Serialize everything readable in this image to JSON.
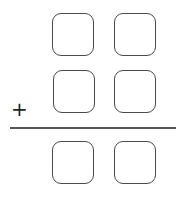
{
  "problem": {
    "type": "vertical-addition",
    "operator": "+",
    "rows": [
      {
        "digits": [
          "",
          ""
        ]
      },
      {
        "digits": [
          "",
          ""
        ]
      }
    ],
    "answer": {
      "digits": [
        "",
        ""
      ]
    }
  },
  "colors": {
    "box_border": "#4a4a4a",
    "line": "#555555",
    "operator": "#222222"
  }
}
